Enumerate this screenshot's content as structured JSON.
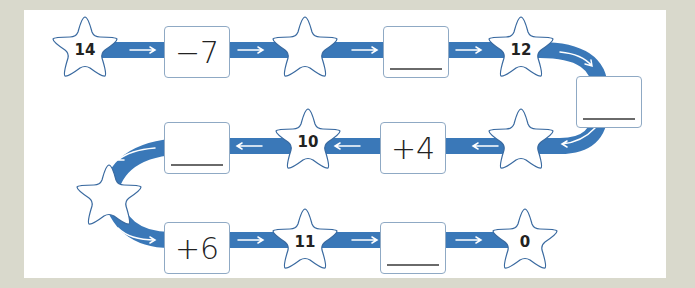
{
  "colors": {
    "background": "#d9d9cc",
    "panel": "#ffffff",
    "track": "#3a78b8",
    "arrow": "#ffffff",
    "star_stroke": "#3a6aa0",
    "box_border": "#8fa9c4"
  },
  "path": {
    "stars": [
      {
        "id": "s1",
        "label": "14"
      },
      {
        "id": "s2",
        "label": ""
      },
      {
        "id": "s3",
        "label": "12"
      },
      {
        "id": "s4",
        "label": ""
      },
      {
        "id": "s5",
        "label": "10"
      },
      {
        "id": "s6",
        "label": ""
      },
      {
        "id": "s7",
        "label": "11"
      },
      {
        "id": "s8",
        "label": "0"
      }
    ],
    "boxes": [
      {
        "id": "b1",
        "label": "−7",
        "blank": false
      },
      {
        "id": "b2",
        "label": "",
        "blank": true
      },
      {
        "id": "b3",
        "label": "",
        "blank": true
      },
      {
        "id": "b4",
        "label": "+4",
        "blank": false
      },
      {
        "id": "b5",
        "label": "",
        "blank": true
      },
      {
        "id": "b6",
        "label": "+6",
        "blank": false
      },
      {
        "id": "b7",
        "label": "",
        "blank": true
      }
    ]
  }
}
